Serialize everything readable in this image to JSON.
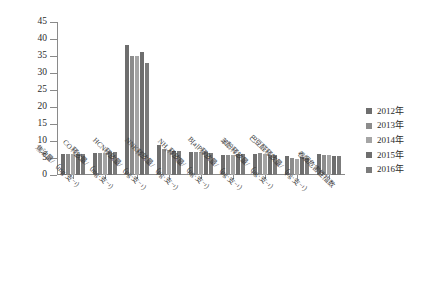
{
  "chart_data": {
    "type": "bar",
    "title": "",
    "subtitle": "",
    "xlabel": "",
    "ylabel": "",
    "ylim": [
      0,
      45
    ],
    "ytick_step": 5,
    "yticks": [
      0,
      5,
      10,
      15,
      20,
      25,
      30,
      35,
      40,
      45
    ],
    "grid": false,
    "legend_position": "right",
    "orientation": "vertical",
    "categories": [
      "焦油量/（mg·支⁻¹）",
      "CO释放量/（mg·支⁻¹）",
      "HCN释放量/（μg·支⁻¹）",
      "NNK释放量/（μg·支⁻¹）",
      "NH₃释放量/（μg·支⁻¹）",
      "B[a]P释放量/（μg·支⁻¹）",
      "苯酚释放量/（μg·支⁻¹）",
      "巴豆醛释放量/（μg·支⁻¹）",
      "卷烟危害性指数"
    ],
    "series": [
      {
        "name": "2012年",
        "color": "#6e6e6e",
        "values": [
          6.1,
          6.6,
          38.1,
          8.7,
          6.9,
          5.9,
          6.1,
          5.6,
          6.2
        ]
      },
      {
        "name": "2013年",
        "color": "#8c8c8c",
        "values": [
          6.1,
          6.4,
          35.0,
          7.6,
          6.9,
          5.9,
          6.4,
          4.9,
          5.9
        ]
      },
      {
        "name": "2014年",
        "color": "#a5a5a5",
        "values": [
          6.1,
          6.5,
          35.0,
          7.4,
          6.9,
          5.9,
          6.3,
          4.6,
          5.8
        ]
      },
      {
        "name": "2015年",
        "color": "#6e6e6e",
        "values": [
          6.2,
          6.9,
          36.2,
          7.0,
          6.7,
          6.1,
          6.0,
          5.2,
          5.7
        ]
      },
      {
        "name": "2016年",
        "color": "#7b7b7b",
        "values": [
          6.2,
          6.9,
          33.0,
          7.1,
          6.6,
          6.1,
          6.0,
          5.1,
          5.7
        ]
      }
    ]
  }
}
